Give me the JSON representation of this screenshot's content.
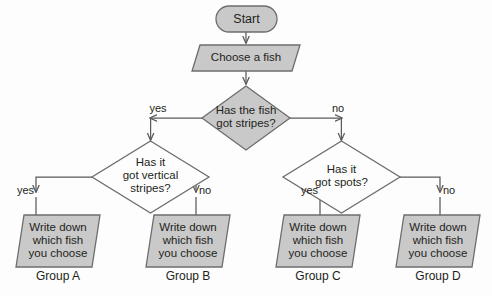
{
  "diagram": {
    "background_color": "#fdfdfd",
    "shape_fill_grey": "#c9c9c9",
    "shape_fill_white": "#fdfdfd",
    "stroke_color": "#6d6d6d",
    "text_color": "#231f20"
  },
  "nodes": {
    "start": {
      "label": "Start",
      "shape": "stadium"
    },
    "choose_fish": {
      "label": "Choose a fish",
      "shape": "parallelogram"
    },
    "decision_stripes": {
      "label": "Has the fish\ngot stripes?",
      "shape": "diamond"
    },
    "decision_vertical_stripes": {
      "label": "Has it\ngot vertical\nstripes?",
      "shape": "diamond"
    },
    "decision_spots": {
      "label": "Has it\ngot spots?",
      "shape": "diamond"
    },
    "output_a": {
      "label": "Write down\nwhich fish\nyou choose",
      "shape": "parallelogram",
      "group": "Group A"
    },
    "output_b": {
      "label": "Write down\nwhich fish\nyou choose",
      "shape": "parallelogram",
      "group": "Group B"
    },
    "output_c": {
      "label": "Write down\nwhich fish\nyou choose",
      "shape": "parallelogram",
      "group": "Group C"
    },
    "output_d": {
      "label": "Write down\nwhich fish\nyou choose",
      "shape": "parallelogram",
      "group": "Group D"
    }
  },
  "edges": {
    "stripes_yes": "yes",
    "stripes_no": "no",
    "vertical_yes": "yes",
    "vertical_no": "no",
    "spots_yes": "yes",
    "spots_no": "no"
  }
}
